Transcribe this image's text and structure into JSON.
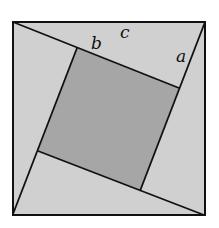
{
  "diagram": {
    "outer_square": {
      "x1": 13,
      "y1": 22,
      "x2": 205,
      "y2": 215
    },
    "inner_square": {
      "points": [
        [
          77,
          48
        ],
        [
          179,
          88
        ],
        [
          140,
          191
        ],
        [
          38,
          151
        ]
      ]
    },
    "lines": [
      {
        "from": [
          13,
          22
        ],
        "to": [
          179,
          88
        ]
      },
      {
        "from": [
          205,
          22
        ],
        "to": [
          140,
          191
        ]
      },
      {
        "from": [
          204,
          215
        ],
        "to": [
          38,
          151
        ]
      },
      {
        "from": [
          13,
          214
        ],
        "to": [
          77,
          48
        ]
      }
    ],
    "labels": {
      "a": "a",
      "b": "b",
      "c": "c"
    },
    "colors": {
      "triangle_fill": "#d0d0d0",
      "inner_square_fill": "#a6a6a6",
      "stroke": "#111111",
      "background": "#ffffff"
    }
  }
}
